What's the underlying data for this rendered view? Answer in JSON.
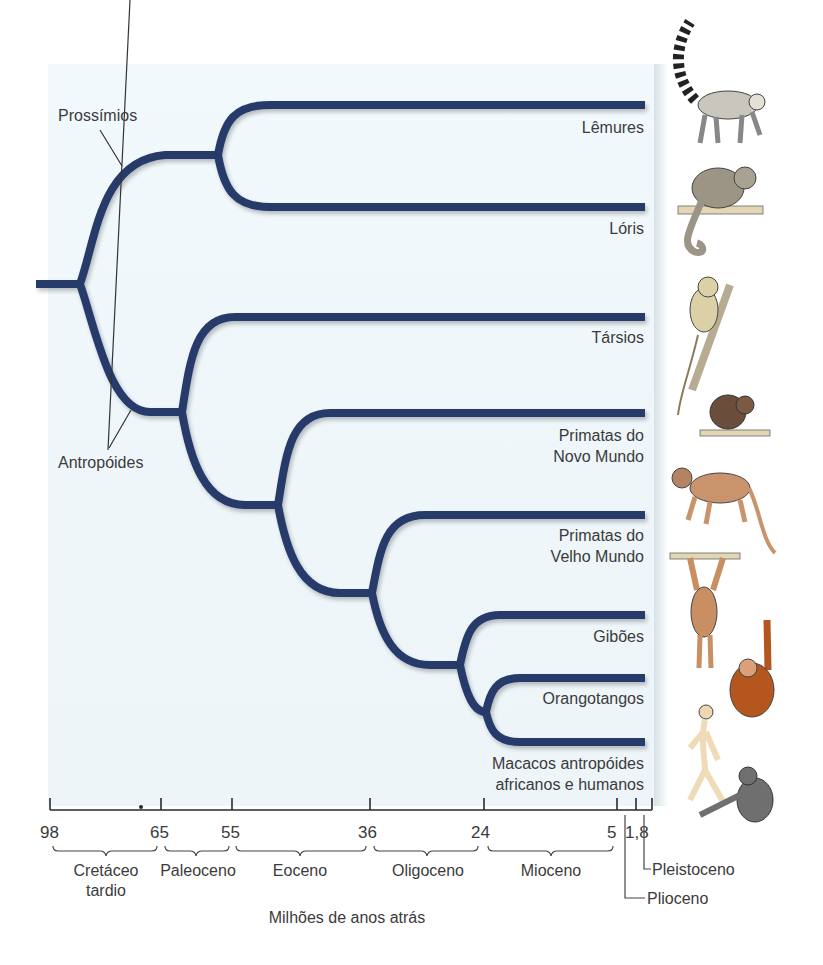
{
  "diagram": {
    "type": "phylogenetic_tree",
    "root_groups": [
      {
        "label": "Prossímios",
        "node_x": 218,
        "node_y": 155
      },
      {
        "label": "Antropóides",
        "node_x": 182,
        "node_y": 412
      }
    ],
    "taxa": [
      {
        "id": "lemures",
        "label_lines": [
          "Lêmures"
        ],
        "y": 105,
        "animal": "ring-tailed-lemur-illustration"
      },
      {
        "id": "loris",
        "label_lines": [
          "Lóris"
        ],
        "y": 207,
        "animal": "loris-illustration"
      },
      {
        "id": "tarsios",
        "label_lines": [
          "Társios"
        ],
        "y": 317,
        "animal": "tarsier-illustration"
      },
      {
        "id": "novo_mundo",
        "label_lines": [
          "Primatas do",
          "Novo Mundo"
        ],
        "y": 413,
        "animal": "new-world-monkey-illustration"
      },
      {
        "id": "velho_mundo",
        "label_lines": [
          "Primatas do",
          "Velho Mundo"
        ],
        "y": 515,
        "animal": "old-world-monkey-illustration"
      },
      {
        "id": "giboes",
        "label_lines": [
          "Gibões"
        ],
        "y": 615,
        "animal": "gibbon-illustration"
      },
      {
        "id": "orangotangos",
        "label_lines": [
          "Orangotangos"
        ],
        "y": 678,
        "animal": "orangutan-illustration"
      },
      {
        "id": "africanos_humanos",
        "label_lines": [
          "Macacos antropóides",
          "africanos e humanos"
        ],
        "y": 742,
        "animal": "human-and-chimpanzee-illustration"
      }
    ],
    "axis": {
      "title": "Milhões de anos atrás",
      "ticks": [
        {
          "value": "98",
          "x": 50
        },
        {
          "value": "65",
          "x": 161
        },
        {
          "value": "55",
          "x": 232
        },
        {
          "value": "36",
          "x": 370
        },
        {
          "value": "24",
          "x": 484
        },
        {
          "value": "5",
          "x": 617
        },
        {
          "value": "1,8",
          "x": 636
        }
      ],
      "end_x": 652,
      "eras": [
        {
          "lines": [
            "Cretáceo",
            "tardio"
          ],
          "from": "98",
          "to": "65"
        },
        {
          "lines": [
            "Paleoceno"
          ],
          "from": "65",
          "to": "55"
        },
        {
          "lines": [
            "Eoceno"
          ],
          "from": "55",
          "to": "36"
        },
        {
          "lines": [
            "Oligoceno"
          ],
          "from": "36",
          "to": "24"
        },
        {
          "lines": [
            "Mioceno"
          ],
          "from": "24",
          "to": "5"
        }
      ],
      "callouts": [
        {
          "label": "Pleistoceno",
          "range": "1,8 – 0"
        },
        {
          "label": "Plioceno",
          "range": "5 – 1,8"
        }
      ]
    },
    "colors": {
      "branch": "#283a6b",
      "panel_bg": "#eff7fb",
      "text": "#3b3b3b",
      "axis": "#2a2a2a"
    }
  }
}
